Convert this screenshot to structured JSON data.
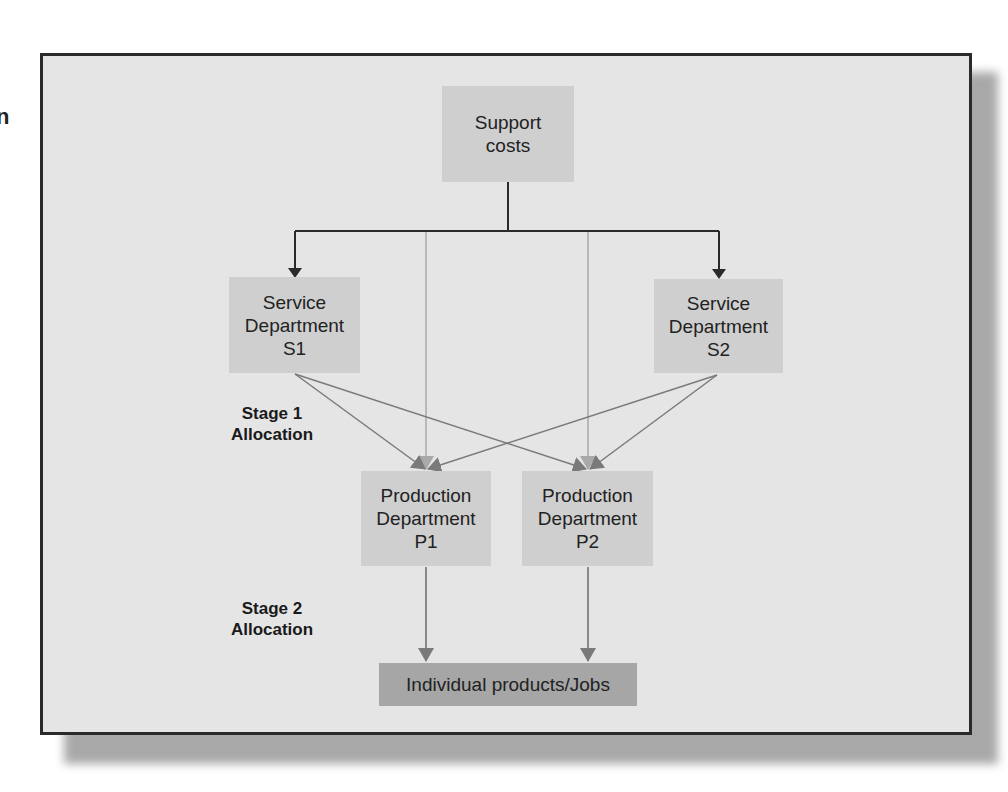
{
  "edge_fragment": "n",
  "diagram": {
    "nodes": {
      "support_costs": "Support\ncosts",
      "service_s1": "Service\nDepartment\nS1",
      "service_s2": "Service\nDepartment\nS2",
      "production_p1": "Production\nDepartment\nP1",
      "production_p2": "Production\nDepartment\nP2",
      "individual_products": "Individual products/Jobs"
    },
    "labels": {
      "stage1": "Stage 1\nAllocation",
      "stage2": "Stage 2\nAllocation"
    },
    "edges": [
      {
        "from": "support_costs",
        "to": "service_s1"
      },
      {
        "from": "support_costs",
        "to": "service_s2"
      },
      {
        "from": "support_costs",
        "to": "production_p1"
      },
      {
        "from": "support_costs",
        "to": "production_p2"
      },
      {
        "from": "service_s1",
        "to": "production_p1"
      },
      {
        "from": "service_s1",
        "to": "production_p2"
      },
      {
        "from": "service_s2",
        "to": "production_p1"
      },
      {
        "from": "service_s2",
        "to": "production_p2"
      },
      {
        "from": "production_p1",
        "to": "individual_products"
      },
      {
        "from": "production_p2",
        "to": "individual_products"
      }
    ],
    "colors": {
      "background": "#e5e5e5",
      "box": "#cfcfcf",
      "box_dark": "#a6a6a6",
      "frame": "#2a2a2a",
      "arrow_dark": "#2a2a2a",
      "arrow_mid": "#7a7a7a",
      "arrow_light": "#a9a9a9"
    }
  }
}
